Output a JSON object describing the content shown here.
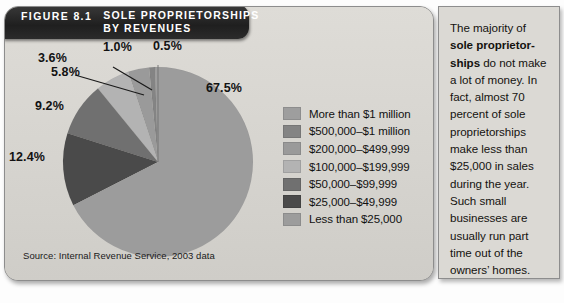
{
  "figure": {
    "number": "FIGURE 8.1",
    "title_line1": "SOLE PROPRIETORSHIPS",
    "title_line2": "BY REVENUES",
    "source": "Source: Internal Revenue Service, 2003 data"
  },
  "note": {
    "lead": "The majority of ",
    "bold": "sole proprietor-ships",
    "rest": " do not make a lot of money. In fact, almost 70 percent of sole proprietorships make less than $25,000 in sales during the year. Such small businesses are usually run part time out of the owners’ homes."
  },
  "legend": {
    "items": [
      {
        "label": "More than $1 million",
        "color": "#9e9e9e"
      },
      {
        "label": "$500,000–$1 million",
        "color": "#848484"
      },
      {
        "label": "$200,000–$499,999",
        "color": "#9a9a9a"
      },
      {
        "label": "$100,000–$199,999",
        "color": "#b3b3b3"
      },
      {
        "label": "$50,000–$99,999",
        "color": "#707070"
      },
      {
        "label": "$25,000–$49,999",
        "color": "#4a4a4a"
      },
      {
        "label": "Less than $25,000",
        "color": "#9c9c9c"
      }
    ]
  },
  "chart_data": {
    "type": "pie",
    "title": "Sole Proprietorships by Revenues",
    "source": "Internal Revenue Service, 2003 data",
    "legend_position": "right",
    "grid": false,
    "categories": [
      "More than $1 million",
      "$500,000–$1 million",
      "$200,000–$499,999",
      "$100,000–$199,999",
      "$50,000–$99,999",
      "$25,000–$49,999",
      "Less than $25,000"
    ],
    "values": [
      0.5,
      1.0,
      3.6,
      5.8,
      9.2,
      12.4,
      67.5
    ],
    "value_labels": [
      "0.5%",
      "1.0%",
      "3.6%",
      "5.8%",
      "9.2%",
      "12.4%",
      "67.5%"
    ],
    "colors": [
      "#9e9e9e",
      "#848484",
      "#9a9a9a",
      "#b3b3b3",
      "#707070",
      "#4a4a4a",
      "#9c9c9c"
    ],
    "units": "percent",
    "total": 100.0
  }
}
